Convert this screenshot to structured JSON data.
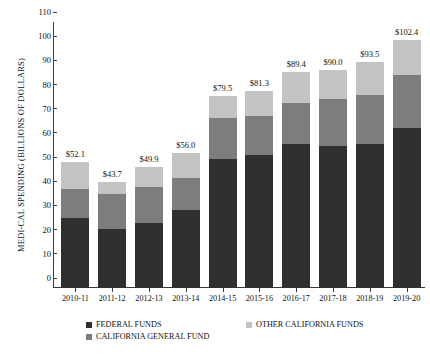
{
  "chart_data": {
    "type": "bar",
    "subtype": "stacked-vertical",
    "title": "",
    "xlabel": "",
    "ylabel": "MEDI-CAL SPENDING (BILLIONS OF DOLLARS)",
    "ylim": [
      0,
      110
    ],
    "ytick_step": 10,
    "yticks": [
      0,
      10,
      20,
      30,
      40,
      50,
      60,
      70,
      80,
      90,
      100,
      110
    ],
    "grid": false,
    "legend_position": "bottom",
    "categories": [
      "2010-11",
      "2011-12",
      "2012-13",
      "2013-14",
      "2014-15",
      "2015-16",
      "2016-17",
      "2017-18",
      "2018-19",
      "2019-20"
    ],
    "series": [
      {
        "name": "FEDERAL FUNDS",
        "color": "#2f2f2f",
        "values": [
          28.8,
          24.3,
          26.9,
          32.1,
          53.4,
          54.8,
          59.6,
          58.6,
          59.5,
          66.1
        ]
      },
      {
        "name": "CALIFORNIA GENERAL FUND",
        "color": "#7d7d7d",
        "values": [
          12.2,
          14.7,
          14.8,
          13.4,
          17.0,
          16.3,
          16.8,
          19.6,
          20.4,
          22.2
        ]
      },
      {
        "name": "OTHER CALIFORNIA FUNDS",
        "color": "#c3c3c3",
        "values": [
          11.1,
          4.7,
          8.2,
          10.5,
          9.1,
          10.2,
          13.0,
          11.8,
          13.6,
          14.1
        ]
      }
    ],
    "totals": [
      52.1,
      43.7,
      49.9,
      56.0,
      79.5,
      81.3,
      89.4,
      90.0,
      93.5,
      102.4
    ],
    "total_labels": [
      "$52.1",
      "$43.7",
      "$49.9",
      "$56.0",
      "$79.5",
      "$81.3",
      "$89.4",
      "$90.0",
      "$93.5",
      "$102.4"
    ],
    "ytick_labels": [
      "0",
      "10",
      "20",
      "30",
      "40",
      "50",
      "60",
      "70",
      "80",
      "90",
      "100",
      "110"
    ]
  }
}
